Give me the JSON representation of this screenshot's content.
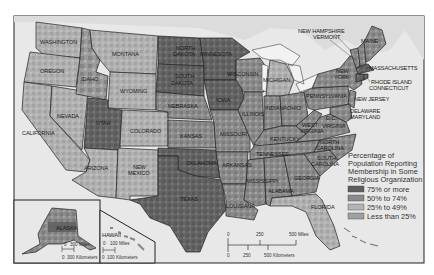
{
  "map": {
    "title": "Percentage of Population Reporting Membership in Some Religious Organization",
    "region": "United States",
    "legend": {
      "title_lines": [
        "Percentage of",
        "Population Reporting",
        "Membership in Some",
        "Religious Organization"
      ],
      "items": [
        {
          "label": "75% or more",
          "color": "#5e5e5e"
        },
        {
          "label": "50% to 74%",
          "color": "#8a8a8a"
        },
        {
          "label": "25% to 49%",
          "color": "#b4b4b4"
        },
        {
          "label": "Less than 25%",
          "color": "#a0a0a0"
        }
      ]
    },
    "colors": {
      "water": "#e6e6e6",
      "land_outside": "#d8d8d8",
      "frame": "#222222",
      "background": "#ffffff"
    },
    "state_labels": {
      "washington": "WASHINGTON",
      "oregon": "OREGON",
      "california": "CALIFORNIA",
      "nevada": "NEVADA",
      "idaho": "IDAHO",
      "montana": "MONTANA",
      "wyoming": "WYOMING",
      "utah": "UTAH",
      "colorado": "COLORADO",
      "arizona": "ARIZONA",
      "new_mexico_1": "NEW",
      "new_mexico_2": "MEXICO",
      "north_dakota_1": "NORTH",
      "north_dakota_2": "DAKOTA",
      "south_dakota_1": "SOUTH",
      "south_dakota_2": "DAKOTA",
      "nebraska": "NEBRASKA",
      "kansas": "KANSAS",
      "oklahoma": "OKLAHOMA",
      "texas": "TEXAS",
      "minnesota": "MINNESOTA",
      "iowa": "IOWA",
      "missouri": "MISSOURI",
      "arkansas": "ARKANSAS",
      "louisiana": "LOUISIANA",
      "wisconsin": "WISCONSIN",
      "illinois": "ILLINOIS",
      "michigan": "MICHIGAN",
      "indiana": "INDIANA",
      "ohio": "OHIO",
      "kentucky": "KENTUCKY",
      "tennessee": "TENNESSEE",
      "mississippi": "MISSISSIPPI",
      "alabama": "ALABAMA",
      "georgia": "GEORGIA",
      "florida": "FLORIDA",
      "south_carolina_1": "SOUTH",
      "south_carolina_2": "CAROLINA",
      "north_carolina_1": "NORTH",
      "north_carolina_2": "CAROLINA",
      "virginia": "VIRGINIA",
      "west_virginia_1": "WEST",
      "west_virginia_2": "VIRGINIA",
      "dc": "D.C.",
      "pennsylvania": "PENNSYLVANIA",
      "new_york_1": "NEW",
      "new_york_2": "YORK",
      "maine": "MAINE",
      "new_hampshire": "NEW HAMPSHIRE",
      "vermont": "VERMONT",
      "massachusetts": "MASSACHUSETTS",
      "rhode_island": "RHODE ISLAND",
      "connecticut": "CONNECTICUT",
      "new_jersey": "NEW JERSEY",
      "delaware": "DELAWARE",
      "maryland": "MARYLAND",
      "alaska": "ALASKA",
      "hawaii": "HAWAII"
    },
    "scales": {
      "main": {
        "miles": [
          "0",
          "250",
          "500 Miles"
        ],
        "km": [
          "0",
          "250",
          "500 Kilometers"
        ]
      },
      "alaska": {
        "miles": [
          "0",
          "300 Miles"
        ],
        "km": [
          "0",
          "300 Kilometers"
        ]
      },
      "hawaii": {
        "miles": [
          "0",
          "100 Miles"
        ],
        "km": [
          "0",
          "100 Kilometers"
        ]
      }
    }
  }
}
